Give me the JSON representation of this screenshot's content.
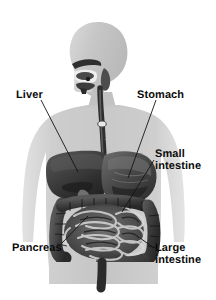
{
  "figure": {
    "width": 216,
    "height": 300,
    "background_color": "#ffffff",
    "style": "grayscale medical illustration",
    "body_silhouette_color": "#c9c9c9",
    "organ_dark_color": "#3a3a3a",
    "label_color": "#0b0b0b",
    "leader_line_color": "#1a1a1a"
  },
  "labels": {
    "liver": {
      "text": "Liver"
    },
    "stomach": {
      "text": "Stomach"
    },
    "small_intestine": {
      "line1": "Small",
      "line2": "intestine"
    },
    "pancreas": {
      "text": "Pancreas"
    },
    "large_intestine": {
      "line1": "Large",
      "line2": "intestine"
    }
  }
}
